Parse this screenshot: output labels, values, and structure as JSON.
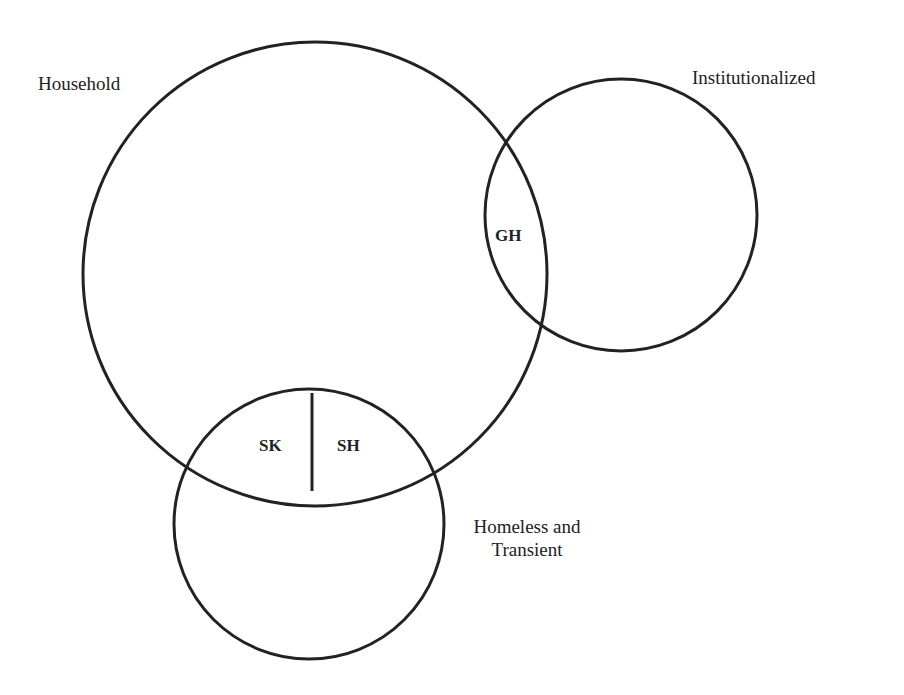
{
  "diagram": {
    "type": "venn",
    "stroke_color": "#222222",
    "background": "#ffffff",
    "sets": [
      {
        "id": "household",
        "label": "Household"
      },
      {
        "id": "institutionalized",
        "label": "Institutionalized"
      },
      {
        "id": "homeless",
        "label": "Homeless and Transient",
        "label_lines": [
          "Homeless and",
          "Transient"
        ]
      }
    ],
    "regions": [
      {
        "id": "gh",
        "label": "GH",
        "sets": [
          "household",
          "institutionalized"
        ]
      },
      {
        "id": "sk",
        "label": "SK",
        "sets": [
          "household",
          "homeless"
        ]
      },
      {
        "id": "sh",
        "label": "SH",
        "sets": [
          "household",
          "homeless"
        ]
      }
    ]
  }
}
